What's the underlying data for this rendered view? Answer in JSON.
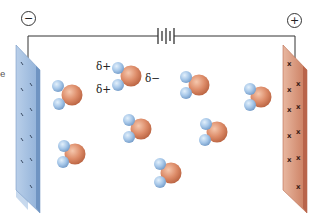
{
  "diagram": {
    "negative_terminal": {
      "symbol": "−",
      "label": "negative terminal"
    },
    "positive_terminal": {
      "symbol": "+",
      "label": "positive terminal"
    },
    "battery": {
      "label": "battery"
    },
    "negative_electrode": {
      "color": "#a9c3e3",
      "charge_marks": "−"
    },
    "positive_electrode": {
      "color": "#e0a58c",
      "charge_marks": "+"
    },
    "partial_charges": {
      "h_top": "δ+",
      "h_bottom": "δ+",
      "oxygen": "δ−"
    },
    "edge_fragment": "e",
    "colors": {
      "oxygen": "#d9825f",
      "hydrogen": "#9bbfe3",
      "wire": "#333333"
    },
    "molecules": [
      {
        "id": 1,
        "o": [
          72,
          95
        ],
        "h1": [
          57,
          86
        ],
        "h2": [
          58,
          104
        ]
      },
      {
        "id": 2,
        "o": [
          131,
          76
        ],
        "h1": [
          118,
          68
        ],
        "h2": [
          118,
          84
        ],
        "labeled": true
      },
      {
        "id": 3,
        "o": [
          199,
          85
        ],
        "h1": [
          186,
          77
        ],
        "h2": [
          186,
          93
        ]
      },
      {
        "id": 4,
        "o": [
          261,
          97
        ],
        "h1": [
          250,
          89
        ],
        "h2": [
          249,
          104
        ]
      },
      {
        "id": 5,
        "o": [
          74,
          154
        ],
        "h1": [
          64,
          146
        ],
        "h2": [
          63,
          162
        ]
      },
      {
        "id": 6,
        "o": [
          141,
          129
        ],
        "h1": [
          129,
          120
        ],
        "h2": [
          128,
          137
        ]
      },
      {
        "id": 7,
        "o": [
          217,
          132
        ],
        "h1": [
          206,
          124
        ],
        "h2": [
          205,
          140
        ]
      },
      {
        "id": 8,
        "o": [
          171,
          173
        ],
        "h1": [
          160,
          164
        ],
        "h2": [
          160,
          182
        ]
      }
    ]
  }
}
